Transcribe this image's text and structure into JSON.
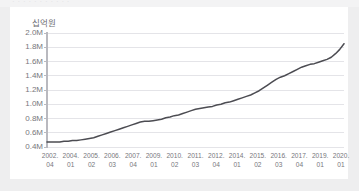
{
  "page": {
    "background_color": "#eeeeef",
    "card_background": "#ffffff",
    "ghost_top_text": "· · · · · · · · · · ·"
  },
  "chart_data": {
    "type": "line",
    "title": "",
    "subtitle": "",
    "xlabel": "",
    "ylabel": "십억원",
    "unit_label": "십억원",
    "grid": "horizontal",
    "legend": "none",
    "line_color": "#4c4c52",
    "grid_color": "#e4e4e8",
    "axis_color": "#b9b9bf",
    "tick_label_color": "#77777c",
    "ylim": [
      0.4,
      2.0
    ],
    "ytick_values": [
      2.0,
      1.8,
      1.6,
      1.4,
      1.2,
      1.0,
      0.8,
      0.6,
      0.4
    ],
    "ytick_labels": [
      "2.0M",
      "1.8M",
      "1.6M",
      "1.4M",
      "1.2M",
      "1.0M",
      "0.8M",
      "0.6M",
      "0.4M"
    ],
    "xtick_labels": [
      {
        "year": "2002.",
        "quarter": "04"
      },
      {
        "year": "2004.",
        "quarter": "01"
      },
      {
        "year": "2005.",
        "quarter": "02"
      },
      {
        "year": "2006.",
        "quarter": "03"
      },
      {
        "year": "2007.",
        "quarter": "04"
      },
      {
        "year": "2009.",
        "quarter": "01"
      },
      {
        "year": "2010.",
        "quarter": "02"
      },
      {
        "year": "2011.",
        "quarter": "03"
      },
      {
        "year": "2012.",
        "quarter": "04"
      },
      {
        "year": "2014.",
        "quarter": "01"
      },
      {
        "year": "2015.",
        "quarter": "02"
      },
      {
        "year": "2016.",
        "quarter": "03"
      },
      {
        "year": "2017.",
        "quarter": "04"
      },
      {
        "year": "2019.",
        "quarter": "01"
      },
      {
        "year": "2020.",
        "quarter": "01"
      }
    ],
    "series": [
      {
        "name": "총액",
        "x": [
          "2002.04",
          "2003.01",
          "2003.02",
          "2003.03",
          "2003.04",
          "2004.01",
          "2004.02",
          "2004.03",
          "2004.04",
          "2005.01",
          "2005.02",
          "2005.03",
          "2005.04",
          "2006.01",
          "2006.02",
          "2006.03",
          "2006.04",
          "2007.01",
          "2007.02",
          "2007.03",
          "2007.04",
          "2008.01",
          "2008.02",
          "2008.03",
          "2008.04",
          "2009.01",
          "2009.02",
          "2009.03",
          "2009.04",
          "2010.01",
          "2010.02",
          "2010.03",
          "2010.04",
          "2011.01",
          "2011.02",
          "2011.03",
          "2011.04",
          "2012.01",
          "2012.02",
          "2012.03",
          "2012.04",
          "2013.01",
          "2013.02",
          "2013.03",
          "2013.04",
          "2014.01",
          "2014.02",
          "2014.03",
          "2014.04",
          "2015.01",
          "2015.02",
          "2015.03",
          "2015.04",
          "2016.01",
          "2016.02",
          "2016.03",
          "2016.04",
          "2017.01",
          "2017.02",
          "2017.03",
          "2017.04",
          "2018.01",
          "2018.02",
          "2018.03",
          "2018.04",
          "2019.01",
          "2019.02",
          "2019.03",
          "2019.04",
          "2020.01",
          "2020.02"
        ],
        "values": [
          0.47,
          0.47,
          0.47,
          0.47,
          0.48,
          0.48,
          0.49,
          0.49,
          0.5,
          0.51,
          0.52,
          0.53,
          0.55,
          0.57,
          0.59,
          0.61,
          0.63,
          0.65,
          0.67,
          0.69,
          0.71,
          0.73,
          0.75,
          0.76,
          0.76,
          0.77,
          0.78,
          0.79,
          0.81,
          0.82,
          0.84,
          0.85,
          0.87,
          0.89,
          0.91,
          0.93,
          0.94,
          0.95,
          0.96,
          0.97,
          0.99,
          1.0,
          1.02,
          1.03,
          1.05,
          1.07,
          1.09,
          1.11,
          1.13,
          1.16,
          1.19,
          1.23,
          1.27,
          1.31,
          1.35,
          1.38,
          1.4,
          1.43,
          1.46,
          1.49,
          1.52,
          1.54,
          1.56,
          1.57,
          1.59,
          1.61,
          1.63,
          1.66,
          1.71,
          1.77,
          1.85
        ]
      }
    ],
    "value_range_observed": {
      "min": 0.47,
      "max": 1.85,
      "units": "M 십억원"
    }
  }
}
